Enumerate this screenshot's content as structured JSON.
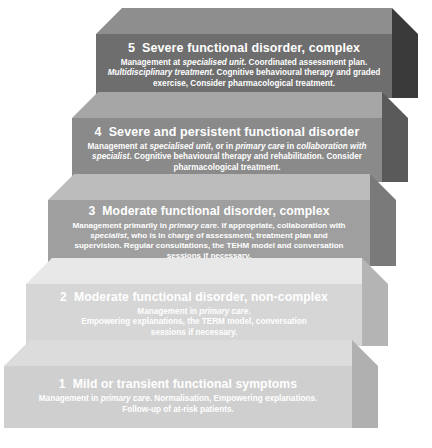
{
  "diagram": {
    "type": "stepped-pyramid",
    "steps": [
      {
        "number": "5",
        "title": "Severe functional disorder, complex",
        "body_lines": [
          [
            {
              "t": "Management at ",
              "i": false
            },
            {
              "t": "specialised unit",
              "i": true
            },
            {
              "t": ". Coordinated assessment plan.",
              "i": false
            }
          ],
          [
            {
              "t": "Multidisciplinary treatment",
              "i": true
            },
            {
              "t": ". Cognitive behavioural therapy and graded",
              "i": false
            }
          ],
          [
            {
              "t": "exercise, Consider pharmacological treatment.",
              "i": false
            }
          ]
        ],
        "colors": {
          "front": "#6e6e6e",
          "top": "#8e8e8e",
          "side": "#3a3a3a"
        }
      },
      {
        "number": "4",
        "title": "Severe and persistent functional disorder",
        "body_lines": [
          [
            {
              "t": "Management at ",
              "i": false
            },
            {
              "t": "specialised unit",
              "i": true
            },
            {
              "t": ", or in ",
              "i": false
            },
            {
              "t": "primary care",
              "i": true
            },
            {
              "t": " in ",
              "i": false
            },
            {
              "t": "collaboration with",
              "i": true
            }
          ],
          [
            {
              "t": "specialist",
              "i": true
            },
            {
              "t": ". Cognitive behavioural therapy and rehabilitation. Consider",
              "i": false
            }
          ],
          [
            {
              "t": "pharmacological treatment.",
              "i": false
            }
          ]
        ],
        "colors": {
          "front": "#8a8a8a",
          "top": "#a6a6a6",
          "side": "#5a5a5a"
        }
      },
      {
        "number": "3",
        "title": "Moderate functional disorder, complex",
        "body_lines": [
          [
            {
              "t": "Management primarily in ",
              "i": false
            },
            {
              "t": "primary care",
              "i": true
            },
            {
              "t": ". If appropriate, collaboration with",
              "i": false
            }
          ],
          [
            {
              "t": "specialist",
              "i": true
            },
            {
              "t": ", who is in charge of assessment, treatment plan and",
              "i": false
            }
          ],
          [
            {
              "t": "supervision. Regular consultations, the TEHM model and conversation",
              "i": false
            }
          ],
          [
            {
              "t": "sessions if necessary.",
              "i": false
            }
          ]
        ],
        "colors": {
          "front": "#9f9f9f",
          "top": "#bcbcbc",
          "side": "#7a7a7a"
        }
      },
      {
        "number": "2",
        "title": "Moderate functional disorder, non-complex",
        "body_lines": [
          [
            {
              "t": "Management in ",
              "i": false
            },
            {
              "t": "primary care",
              "i": true
            },
            {
              "t": ".",
              "i": false
            }
          ],
          [
            {
              "t": "Empowering explanations, the TERM model, conversation",
              "i": false
            }
          ],
          [
            {
              "t": "sessions if necessary.",
              "i": false
            }
          ]
        ],
        "colors": {
          "front": "#d6d6d6",
          "top": "#e8e8e8",
          "side": "#b4b4b4"
        }
      },
      {
        "number": "1",
        "title": "Mild or transient functional symptoms",
        "body_lines": [
          [
            {
              "t": "Management in ",
              "i": false
            },
            {
              "t": "primary care",
              "i": true
            },
            {
              "t": ". Normalisation, Empowering explanations.",
              "i": false
            }
          ],
          [
            {
              "t": "Follow-up of at-risk patients.",
              "i": false
            }
          ]
        ],
        "colors": {
          "front": "#cfcfcf",
          "top": "#dcdcdc",
          "side": "#b0b0b0"
        }
      }
    ]
  }
}
